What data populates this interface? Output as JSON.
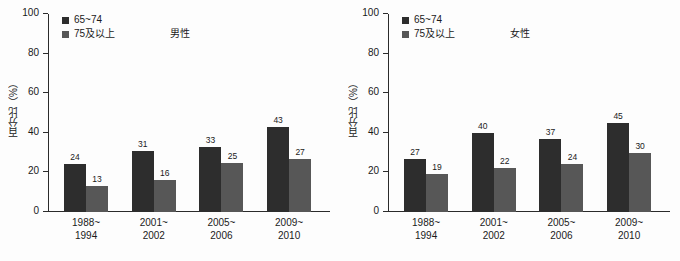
{
  "chart_data": [
    {
      "type": "bar",
      "title": "男性",
      "xlabel": "",
      "ylabel": "百分比（%）",
      "ylim": [
        0,
        100
      ],
      "yticks": [
        0,
        20,
        40,
        60,
        80,
        100
      ],
      "grid": false,
      "legend_position": "top-left",
      "categories": [
        "1988~\n1994",
        "2001~\n2002",
        "2005~\n2006",
        "2009~\n2010"
      ],
      "category_lines": [
        [
          "1988~",
          "1994"
        ],
        [
          "2001~",
          "2002"
        ],
        [
          "2005~",
          "2006"
        ],
        [
          "2009~",
          "2010"
        ]
      ],
      "series": [
        {
          "name": "65~74",
          "color": "#2d2d2d",
          "values": [
            24,
            31,
            33,
            43
          ]
        },
        {
          "name": "75及以上",
          "color": "#575757",
          "values": [
            13,
            16,
            25,
            27
          ]
        }
      ]
    },
    {
      "type": "bar",
      "title": "女性",
      "xlabel": "",
      "ylabel": "百分比（%）",
      "ylim": [
        0,
        100
      ],
      "yticks": [
        0,
        20,
        40,
        60,
        80,
        100
      ],
      "grid": false,
      "legend_position": "top-left",
      "categories": [
        "1988~\n1994",
        "2001~\n2002",
        "2005~\n2006",
        "2009~\n2010"
      ],
      "category_lines": [
        [
          "1988~",
          "1994"
        ],
        [
          "2001~",
          "2002"
        ],
        [
          "2005~",
          "2006"
        ],
        [
          "2009~",
          "2010"
        ]
      ],
      "series": [
        {
          "name": "65~74",
          "color": "#2d2d2d",
          "values": [
            27,
            40,
            37,
            45
          ]
        },
        {
          "name": "75及以上",
          "color": "#575757",
          "values": [
            19,
            22,
            24,
            30
          ]
        }
      ]
    }
  ],
  "colors": {
    "series_dark": "#2d2d2d",
    "series_light": "#575757",
    "axis": "#2b2b2b",
    "background": "#fdfdfd",
    "text": "#1a1a1a"
  }
}
